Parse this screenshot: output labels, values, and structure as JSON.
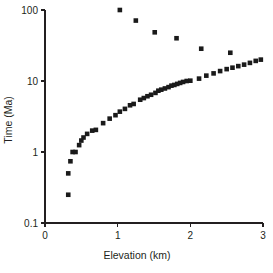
{
  "chart_data": {
    "type": "scatter",
    "title": "",
    "xlabel": "Elevation (km)",
    "ylabel": "Time (Ma)",
    "xlim": [
      0,
      3
    ],
    "ylim": [
      0.1,
      100
    ],
    "yscale": "log",
    "xscale": "linear",
    "grid": false,
    "legend": null,
    "xticks": [
      "0",
      "1",
      "2",
      "3"
    ],
    "xtick_values": [
      0,
      1,
      2,
      3
    ],
    "yticks": [
      "0.1",
      "1",
      "10",
      "100"
    ],
    "ytick_values": [
      0.1,
      1,
      10,
      100
    ],
    "marker": "square",
    "marker_color": "#1a1a1a",
    "marker_size": 4.6,
    "series": [
      {
        "name": "main-trend",
        "points": [
          [
            0.32,
            0.25
          ],
          [
            0.32,
            0.5
          ],
          [
            0.35,
            0.74
          ],
          [
            0.38,
            1.0
          ],
          [
            0.42,
            1.0
          ],
          [
            0.47,
            1.25
          ],
          [
            0.5,
            1.45
          ],
          [
            0.53,
            1.6
          ],
          [
            0.58,
            1.8
          ],
          [
            0.65,
            2.0
          ],
          [
            0.7,
            2.05
          ],
          [
            0.8,
            2.55
          ],
          [
            0.89,
            2.95
          ],
          [
            0.97,
            3.3
          ],
          [
            1.03,
            3.7
          ],
          [
            1.1,
            4.05
          ],
          [
            1.17,
            4.55
          ],
          [
            1.22,
            4.75
          ],
          [
            1.31,
            5.45
          ],
          [
            1.36,
            5.75
          ],
          [
            1.41,
            6.1
          ],
          [
            1.46,
            6.4
          ],
          [
            1.52,
            6.8
          ],
          [
            1.56,
            7.3
          ],
          [
            1.6,
            7.55
          ],
          [
            1.65,
            7.85
          ],
          [
            1.7,
            8.2
          ],
          [
            1.74,
            8.6
          ],
          [
            1.78,
            8.8
          ],
          [
            1.82,
            9.1
          ],
          [
            1.86,
            9.4
          ],
          [
            1.9,
            9.7
          ],
          [
            1.95,
            10.0
          ],
          [
            2.0,
            10.1
          ],
          [
            2.12,
            10.8
          ],
          [
            2.22,
            11.9
          ],
          [
            2.32,
            12.8
          ],
          [
            2.41,
            13.8
          ],
          [
            2.5,
            14.7
          ],
          [
            2.58,
            15.4
          ],
          [
            2.66,
            16.2
          ],
          [
            2.74,
            17.0
          ],
          [
            2.82,
            18.0
          ],
          [
            2.9,
            19.2
          ],
          [
            2.97,
            20.0
          ]
        ]
      },
      {
        "name": "upper-outliers",
        "points": [
          [
            1.03,
            100.0
          ],
          [
            1.25,
            71.0
          ],
          [
            1.51,
            48.5
          ],
          [
            1.81,
            40.0
          ],
          [
            2.15,
            28.5
          ],
          [
            2.55,
            25.0
          ]
        ]
      }
    ]
  },
  "figure": {
    "background_color": "#ffffff",
    "axis_color": "#231f20"
  }
}
